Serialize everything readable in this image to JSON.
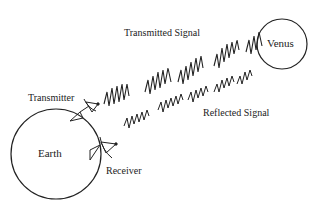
{
  "diagram": {
    "nodes": {
      "earth": {
        "label": "Earth"
      },
      "venus": {
        "label": "Venus"
      }
    },
    "labels": {
      "transmitter": "Transmitter",
      "receiver": "Receiver",
      "transmitted_signal": "Transmitted Signal",
      "reflected_signal": "Reflected Signal"
    },
    "edges": [
      {
        "from": "transmitter",
        "to": "venus",
        "label": "Transmitted Signal"
      },
      {
        "from": "venus",
        "to": "receiver",
        "label": "Reflected Signal"
      }
    ],
    "colors": {
      "stroke": "#222222",
      "background": "#ffffff"
    }
  }
}
